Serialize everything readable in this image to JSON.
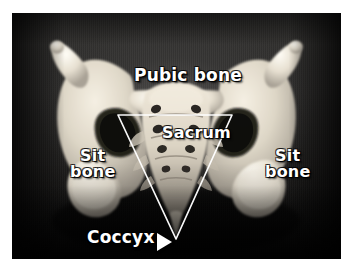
{
  "figure": {
    "kind": "anatomical-photograph",
    "frame_color": "#ffffff",
    "background_color": "#2b2b2b",
    "bone_color": "#e8e2d6",
    "annotation_color": "#ffffff"
  },
  "labels": {
    "pubic_bone": "Pubic bone",
    "sacrum": "Sacrum",
    "sit_bone_left": "Sit\nbone",
    "sit_bone_right": "Sit\nbone",
    "coccyx": "Coccyx"
  },
  "icons": {
    "coccyx_pointer": "triangle-right-icon",
    "pelvic_outlet": "triangle-outline-icon"
  }
}
